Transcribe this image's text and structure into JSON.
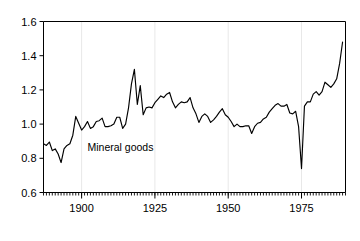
{
  "chart_data": {
    "type": "line",
    "title": "",
    "subtitle": "",
    "xlabel": "",
    "ylabel": "",
    "xlim": [
      1887,
      1990
    ],
    "ylim": [
      0.6,
      1.6
    ],
    "grid": "vertical-gridlines-at-major-x-ticks",
    "legend": "none",
    "annotations": [
      {
        "text": "Mineral goods",
        "x": 1902,
        "y": 0.845
      }
    ],
    "x_ticks_major": [
      1900,
      1925,
      1950,
      1975
    ],
    "x_tick_labels": [
      "1900",
      "1925",
      "1950",
      "1975"
    ],
    "x_ticks_minor_interval": 1,
    "y_ticks": [
      0.6,
      0.8,
      1.0,
      1.2,
      1.4,
      1.6
    ],
    "y_tick_labels": [
      "0.6",
      "0.8",
      "1.0",
      "1.2",
      "1.4",
      "1.6"
    ],
    "series": [
      {
        "name": "Mineral goods",
        "color": "#000000",
        "x": [
          1887,
          1888,
          1889,
          1890,
          1891,
          1892,
          1893,
          1894,
          1895,
          1896,
          1897,
          1898,
          1899,
          1900,
          1901,
          1902,
          1903,
          1904,
          1905,
          1906,
          1907,
          1908,
          1909,
          1910,
          1911,
          1912,
          1913,
          1914,
          1915,
          1916,
          1917,
          1918,
          1919,
          1920,
          1921,
          1922,
          1923,
          1924,
          1925,
          1926,
          1927,
          1928,
          1929,
          1930,
          1931,
          1932,
          1933,
          1934,
          1935,
          1936,
          1937,
          1938,
          1939,
          1940,
          1941,
          1942,
          1943,
          1944,
          1945,
          1946,
          1947,
          1948,
          1949,
          1950,
          1951,
          1952,
          1953,
          1954,
          1955,
          1956,
          1957,
          1958,
          1959,
          1960,
          1961,
          1962,
          1963,
          1964,
          1965,
          1966,
          1967,
          1968,
          1969,
          1970,
          1971,
          1972,
          1973,
          1974,
          1975,
          1976,
          1977,
          1978,
          1979,
          1980,
          1981,
          1982,
          1983,
          1984,
          1985,
          1986,
          1987,
          1988,
          1989
        ],
        "y": [
          0.885,
          0.875,
          0.895,
          0.845,
          0.855,
          0.825,
          0.775,
          0.855,
          0.875,
          0.885,
          0.935,
          1.045,
          1.005,
          0.965,
          0.985,
          1.015,
          0.975,
          0.985,
          1.015,
          1.02,
          1.035,
          0.985,
          0.985,
          0.99,
          1.0,
          1.04,
          1.04,
          0.975,
          1.0,
          1.095,
          1.235,
          1.32,
          1.115,
          1.225,
          1.055,
          1.095,
          1.1,
          1.095,
          1.125,
          1.145,
          1.165,
          1.155,
          1.175,
          1.185,
          1.13,
          1.095,
          1.115,
          1.13,
          1.125,
          1.13,
          1.155,
          1.095,
          1.06,
          1.01,
          1.045,
          1.06,
          1.045,
          1.01,
          1.025,
          1.045,
          1.07,
          1.09,
          1.055,
          1.04,
          1.015,
          0.985,
          1.0,
          0.985,
          0.985,
          0.99,
          0.99,
          0.945,
          0.985,
          1.005,
          1.01,
          1.03,
          1.04,
          1.07,
          1.09,
          1.11,
          1.12,
          1.105,
          1.105,
          1.115,
          1.065,
          1.06,
          1.075,
          0.985,
          0.74,
          1.105,
          1.13,
          1.13,
          1.175,
          1.19,
          1.17,
          1.19,
          1.245,
          1.23,
          1.215,
          1.235,
          1.265,
          1.355,
          1.48
        ]
      }
    ]
  },
  "axes": {
    "y_axis_name": "y-axis",
    "x_axis_name": "x-axis"
  }
}
